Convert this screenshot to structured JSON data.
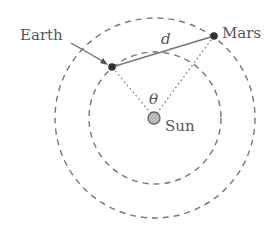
{
  "diagram": {
    "labels": {
      "earth": "Earth",
      "mars": "Mars",
      "sun": "Sun",
      "distance": "d",
      "angle": "θ"
    },
    "colors": {
      "orbit_line": "#777777",
      "distance_line": "#777777",
      "planet_dot": "#333333",
      "sun_fill": "#bbbbbb",
      "sun_stroke": "#666666",
      "label_text": "#555555",
      "dotted_line": "#777777"
    },
    "geometry": {
      "sun_center": [
        155,
        118
      ],
      "earth_orbit_radius": 66,
      "mars_orbit_radius": 100,
      "earth_position": [
        112,
        67
      ],
      "mars_position": [
        214,
        36
      ]
    }
  }
}
